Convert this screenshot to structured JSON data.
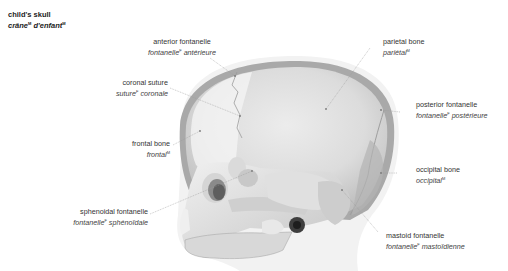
{
  "title": {
    "en": "child's skull",
    "fr": "crâne",
    "fr_gender": "M",
    "fr2": "d'enfant",
    "fr2_gender": "M"
  },
  "labels": [
    {
      "id": "anterior-fontanelle",
      "en": "anterior fontanelle",
      "fr": "fontanelle",
      "gender": "F",
      "fr_rest": "antérieure"
    },
    {
      "id": "coronal-suture",
      "en": "coronal suture",
      "fr": "suture",
      "gender": "F",
      "fr_rest": "coronale"
    },
    {
      "id": "frontal-bone",
      "en": "frontal bone",
      "fr": "frontal",
      "gender": "M",
      "fr_rest": ""
    },
    {
      "id": "sphenoidal-fontanelle",
      "en": "sphenoidal fontanelle",
      "fr": "fontanelle",
      "gender": "F",
      "fr_rest": "sphénoïdale"
    },
    {
      "id": "parietal-bone",
      "en": "parietal bone",
      "fr": "pariétal",
      "gender": "M",
      "fr_rest": ""
    },
    {
      "id": "posterior-fontanelle",
      "en": "posterior fontanelle",
      "fr": "fontanelle",
      "gender": "F",
      "fr_rest": "postérieure"
    },
    {
      "id": "occipital-bone",
      "en": "occipital bone",
      "fr": "occipital",
      "gender": "M",
      "fr_rest": ""
    },
    {
      "id": "mastoid-fontanelle",
      "en": "mastoid fontanelle",
      "fr": "fontanelle",
      "gender": "F",
      "fr_rest": "mastoïdienne"
    }
  ],
  "colors": {
    "bone": "#e4e4e4",
    "shadow": "#a8a8a8",
    "outline": "#bdbdbd",
    "leader": "#9a9a9a"
  }
}
